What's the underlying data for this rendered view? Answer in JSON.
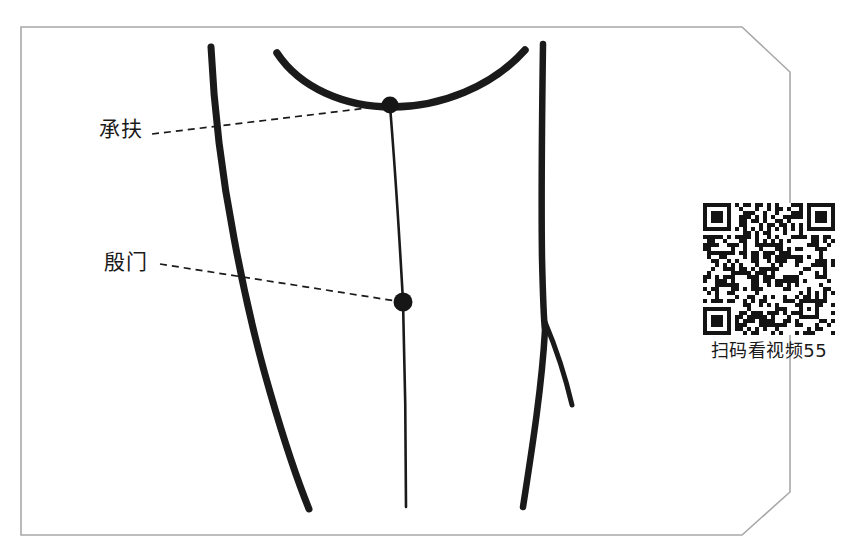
{
  "page": {
    "background_color": "#ffffff",
    "ink_color": "#1a1a1a",
    "frame_color": "#a0a0a0"
  },
  "frame": {
    "name": "illustration-border",
    "style": "thin rectangle with chamfered right corners",
    "left": 21,
    "top": 27,
    "right": 790,
    "bottom": 535,
    "chamfer": 26
  },
  "labels": [
    {
      "id": "chengfu",
      "text": "承扶",
      "pinyin_hidden": null,
      "x": 99,
      "y": 119
    },
    {
      "id": "yinmen",
      "text": "殷门",
      "pinyin_hidden": null,
      "x": 104,
      "y": 252
    }
  ],
  "acupoints": [
    {
      "id": "chengfu",
      "label": "承扶",
      "cx": 390,
      "cy": 105,
      "r": 8
    },
    {
      "id": "yinmen",
      "label": "殷门",
      "cx": 403,
      "cy": 302,
      "r": 9
    }
  ],
  "leader_lines": [
    {
      "id": "chengfu-leader",
      "from_x": 152,
      "from_y": 134,
      "to_x": 384,
      "to_y": 106
    },
    {
      "id": "yinmen-leader",
      "from_x": 160,
      "from_y": 264,
      "to_x": 396,
      "to_y": 301
    }
  ],
  "qr": {
    "caption": "扫码看视频 55",
    "caption_raw": "扫码看视频55",
    "video_number": "55",
    "x": 700,
    "y": 203,
    "size": 132,
    "modules": 33
  },
  "icons": {
    "qr_code": "qr-code-icon",
    "acupoint_dot": "acupoint-dot-icon"
  }
}
